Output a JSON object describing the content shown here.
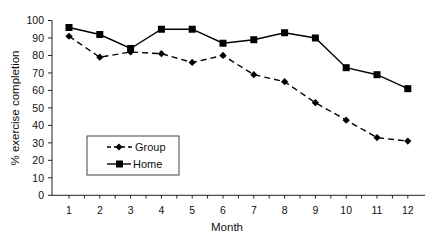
{
  "chart_data": {
    "type": "line",
    "title": "",
    "xlabel": "Month",
    "ylabel": "% exercise completion",
    "categories": [
      "1",
      "2",
      "3",
      "4",
      "5",
      "6",
      "7",
      "8",
      "9",
      "10",
      "11",
      "12"
    ],
    "x": [
      1,
      2,
      3,
      4,
      5,
      6,
      7,
      8,
      9,
      10,
      11,
      12
    ],
    "yticks": [
      0,
      10,
      20,
      30,
      40,
      50,
      60,
      70,
      80,
      90,
      100
    ],
    "ylim": [
      0,
      100
    ],
    "grid": false,
    "legend_position": "lower left (inside plot)",
    "series": [
      {
        "name": "Group",
        "style": "dashed",
        "marker": "diamond",
        "color": "#000000",
        "values": [
          91,
          79,
          82,
          81,
          76,
          80,
          69,
          65,
          53,
          43,
          33,
          31
        ]
      },
      {
        "name": "Home",
        "style": "solid",
        "marker": "square",
        "color": "#000000",
        "values": [
          96,
          92,
          84,
          95,
          95,
          87,
          89,
          93,
          90,
          73,
          69,
          61
        ]
      }
    ]
  },
  "legend": {
    "items": [
      {
        "label": "Group"
      },
      {
        "label": "Home"
      }
    ]
  },
  "axes": {
    "x_title": "Month",
    "y_title": "% exercise completion"
  }
}
